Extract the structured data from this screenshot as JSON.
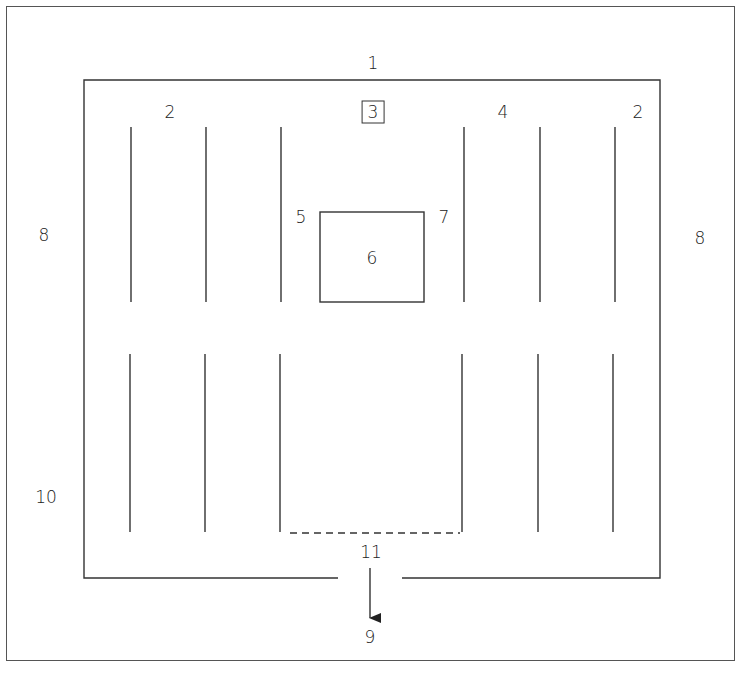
{
  "diagram": {
    "type": "floor-plan",
    "labels": {
      "top_outside": "1",
      "top_left": "2",
      "top_center_boxed": "3",
      "top_right_inner": "4",
      "top_right": "2",
      "box_left": "5",
      "box_center": "6",
      "box_right": "7",
      "side_left": "8",
      "side_right": "8",
      "exit_outside": "9",
      "bottom_left": "10",
      "bottom_center": "11"
    },
    "colors": {
      "line": "#333333",
      "background": "#ffffff"
    }
  }
}
